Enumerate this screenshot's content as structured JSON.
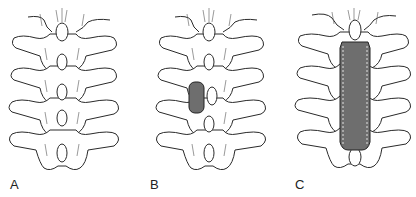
{
  "figure": {
    "panels": [
      {
        "id": "A",
        "label": "A",
        "state": "intact posterior elements",
        "graft": null
      },
      {
        "id": "B",
        "label": "B",
        "state": "single-level shaded block beside spinous process",
        "graft": {
          "levels": 1,
          "side": "left"
        }
      },
      {
        "id": "C",
        "label": "C",
        "state": "long shaded strip spanning multiple levels along midline",
        "graft": {
          "levels": 3,
          "side": "midline"
        }
      }
    ],
    "colors": {
      "line": "#2a2a2a",
      "fill": "#ffffff",
      "shade": "#6e6e6e",
      "background": "#ffffff"
    }
  }
}
